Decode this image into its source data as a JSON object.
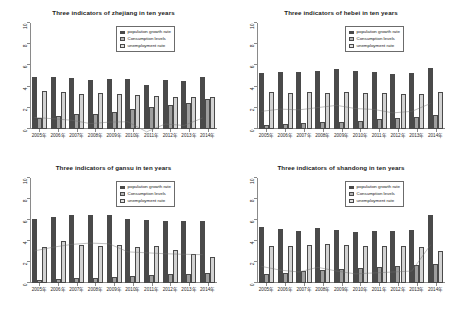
{
  "figure": {
    "layout": "2x2 grid of bar charts",
    "panel_order": [
      "zhejiang",
      "hebei",
      "gansu",
      "shandong"
    ]
  },
  "legend": {
    "position": "top-right inside plot",
    "entries": [
      {
        "label": "population growth rate",
        "color": "#4a4a4a"
      },
      {
        "label": "Consumption levels",
        "color": "#b5b5b5"
      },
      {
        "label": "unemployment rate",
        "color": "#e0e0e0"
      }
    ]
  },
  "chart_data": [
    {
      "type": "bar",
      "title": "Three indicators of zhejiang in ten years",
      "xlabel": "",
      "ylabel": "",
      "ylim": [
        0,
        10
      ],
      "yticks": [
        0,
        2,
        4,
        6,
        8,
        10
      ],
      "grid": false,
      "categories": [
        "2005年",
        "2006年",
        "2007年",
        "2008年",
        "2009年",
        "2010年",
        "2011年",
        "2012年",
        "2013年",
        "2014年"
      ],
      "series": [
        {
          "name": "population growth rate",
          "values": [
            4.95,
            4.88,
            4.8,
            4.62,
            4.7,
            4.72,
            4.18,
            4.6,
            4.52,
            4.92
          ]
        },
        {
          "name": "Consumption levels",
          "values": [
            1.05,
            1.2,
            1.45,
            1.4,
            1.62,
            1.85,
            2.12,
            2.28,
            2.42,
            2.8
          ]
        },
        {
          "name": "unemployment rate",
          "values": [
            3.6,
            3.45,
            3.28,
            3.42,
            3.3,
            3.22,
            3.12,
            3.05,
            3.05,
            3.0
          ]
        }
      ],
      "trend_line": [
        4.95,
        4.88,
        4.8,
        4.62,
        4.7,
        4.72,
        4.18,
        4.6,
        4.52,
        4.92
      ]
    },
    {
      "type": "bar",
      "title": "Three indicators of hebei in ten years",
      "xlabel": "",
      "ylabel": "",
      "ylim": [
        0,
        10
      ],
      "yticks": [
        0,
        2,
        4,
        6,
        8,
        10
      ],
      "grid": false,
      "categories": [
        "2005年",
        "2006年",
        "2007年",
        "2008年",
        "2009年",
        "2010年",
        "2011年",
        "2012年",
        "2013年",
        "2014年"
      ],
      "series": [
        {
          "name": "population growth rate",
          "values": [
            5.3,
            5.42,
            5.38,
            5.5,
            5.62,
            5.45,
            5.4,
            5.22,
            5.3,
            5.72
          ]
        },
        {
          "name": "Consumption levels",
          "values": [
            0.42,
            0.48,
            0.55,
            0.62,
            0.7,
            0.8,
            0.92,
            1.02,
            1.18,
            1.32
          ]
        },
        {
          "name": "unemployment rate",
          "values": [
            3.45,
            3.42,
            3.48,
            3.38,
            3.45,
            3.4,
            3.42,
            3.3,
            3.35,
            3.5
          ]
        }
      ],
      "trend_line": [
        5.3,
        5.42,
        5.38,
        5.5,
        5.62,
        5.45,
        5.4,
        5.22,
        5.3,
        5.72
      ]
    },
    {
      "type": "bar",
      "title": "Three indicators of gansu in ten years",
      "xlabel": "",
      "ylabel": "",
      "ylim": [
        0,
        10
      ],
      "yticks": [
        0,
        2,
        4,
        6,
        8,
        10
      ],
      "grid": false,
      "categories": [
        "2005年",
        "2006年",
        "2007年",
        "2008年",
        "2009年",
        "2010年",
        "2011年",
        "2012年",
        "2013年",
        "2014年"
      ],
      "series": [
        {
          "name": "population growth rate",
          "values": [
            6.1,
            6.3,
            6.45,
            6.52,
            6.48,
            6.05,
            6.0,
            5.95,
            5.92,
            5.9
          ]
        },
        {
          "name": "Consumption levels",
          "values": [
            0.3,
            0.38,
            0.45,
            0.5,
            0.58,
            0.68,
            0.72,
            0.82,
            0.88,
            1.0
          ]
        },
        {
          "name": "unemployment rate",
          "values": [
            3.45,
            4.0,
            3.6,
            3.55,
            3.58,
            3.42,
            3.48,
            3.1,
            2.8,
            2.5
          ]
        }
      ],
      "trend_line": [
        6.1,
        6.3,
        6.45,
        6.52,
        6.48,
        6.05,
        6.0,
        5.95,
        5.92,
        5.9
      ]
    },
    {
      "type": "bar",
      "title": "Three indicators of shandong in ten years",
      "xlabel": "",
      "ylabel": "",
      "ylim": [
        0,
        10
      ],
      "yticks": [
        0,
        2,
        4,
        6,
        8,
        10
      ],
      "grid": false,
      "categories": [
        "2005年",
        "2006年",
        "2007年",
        "2008年",
        "2009年",
        "2010年",
        "2011年",
        "2012年",
        "2013年",
        "2014年"
      ],
      "series": [
        {
          "name": "population growth rate",
          "values": [
            5.3,
            5.1,
            5.0,
            5.25,
            5.05,
            4.9,
            4.95,
            5.0,
            5.05,
            6.45
          ]
        },
        {
          "name": "Consumption levels",
          "values": [
            0.85,
            1.0,
            1.12,
            1.22,
            1.32,
            1.42,
            1.52,
            1.6,
            1.7,
            1.8
          ]
        },
        {
          "name": "unemployment rate",
          "values": [
            3.55,
            3.55,
            3.6,
            3.72,
            3.6,
            3.55,
            3.55,
            3.48,
            3.45,
            3.05
          ]
        }
      ],
      "trend_line": [
        5.3,
        5.1,
        5.0,
        5.25,
        5.05,
        4.9,
        4.95,
        5.0,
        5.05,
        6.45
      ]
    }
  ]
}
